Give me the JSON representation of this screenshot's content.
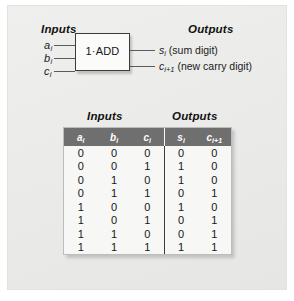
{
  "figure": {
    "diagram": {
      "inputs_heading": "Inputs",
      "outputs_heading": "Outputs",
      "block_label": "1·ADD",
      "input_ports": [
        {
          "name": "a",
          "sub": "i"
        },
        {
          "name": "b",
          "sub": "i"
        },
        {
          "name": "c",
          "sub": "i"
        }
      ],
      "output_ports": [
        {
          "name": "s",
          "sub": "i",
          "description": "(sum digit)"
        },
        {
          "name": "c",
          "sub": "i+1",
          "description": "(new carry digit)"
        }
      ]
    },
    "table": {
      "inputs_heading": "Inputs",
      "outputs_heading": "Outputs",
      "columns": [
        {
          "name": "a",
          "sub": "i",
          "group": "inputs"
        },
        {
          "name": "b",
          "sub": "i",
          "group": "inputs"
        },
        {
          "name": "c",
          "sub": "i",
          "group": "inputs"
        },
        {
          "name": "s",
          "sub": "i",
          "group": "outputs"
        },
        {
          "name": "c",
          "sub": "i+1",
          "group": "outputs"
        }
      ],
      "rows": [
        {
          "a_i": "0",
          "b_i": "0",
          "c_i": "0",
          "s_i": "0",
          "c_i1": "0"
        },
        {
          "a_i": "0",
          "b_i": "0",
          "c_i": "1",
          "s_i": "1",
          "c_i1": "0"
        },
        {
          "a_i": "0",
          "b_i": "1",
          "c_i": "0",
          "s_i": "1",
          "c_i1": "0"
        },
        {
          "a_i": "0",
          "b_i": "1",
          "c_i": "1",
          "s_i": "0",
          "c_i1": "1"
        },
        {
          "a_i": "1",
          "b_i": "0",
          "c_i": "0",
          "s_i": "1",
          "c_i1": "0"
        },
        {
          "a_i": "1",
          "b_i": "0",
          "c_i": "1",
          "s_i": "0",
          "c_i1": "1"
        },
        {
          "a_i": "1",
          "b_i": "1",
          "c_i": "0",
          "s_i": "0",
          "c_i1": "1"
        },
        {
          "a_i": "1",
          "b_i": "1",
          "c_i": "1",
          "s_i": "1",
          "c_i1": "1"
        }
      ]
    },
    "colors": {
      "panel_background": "#ececeb",
      "header_row_background": "#6f6f6f",
      "header_row_text": "#ffffff",
      "table_background": "#f7f7f6",
      "wire": "#5b5b5b",
      "text": "#161616"
    }
  }
}
